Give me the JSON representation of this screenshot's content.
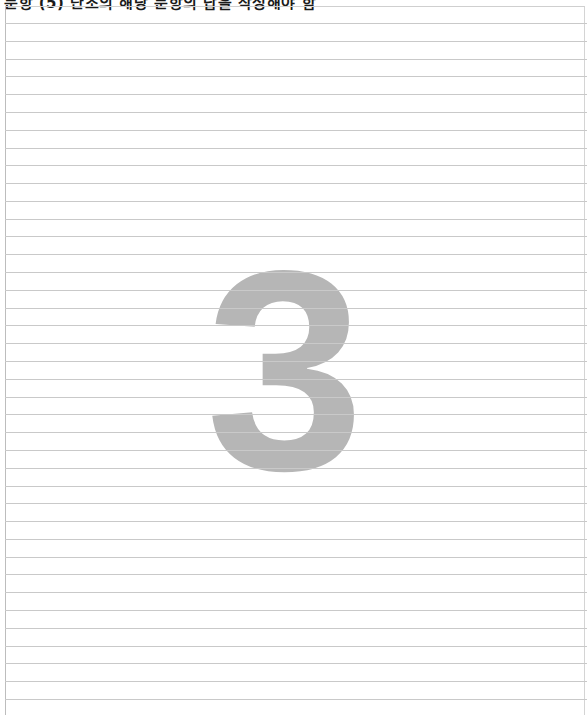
{
  "header": {
    "instruction_text": "문항 (5) 단조의 해당 문항의 답을 작성해야 함"
  },
  "answer_sheet": {
    "page_marker": "3",
    "ruled_line_count": 39,
    "line_color": "#c9c9c9",
    "marker_color": "#b6b6b6"
  }
}
